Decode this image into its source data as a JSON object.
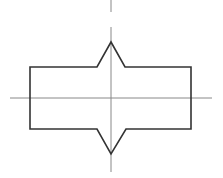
{
  "diagram": {
    "type": "technical-drawing",
    "colors": {
      "background": "#ffffff",
      "outline": "#333333",
      "center_line": "#888888"
    },
    "outline_points": "30,67 97,67 111,42 125,67 191,67 191,129 126,129 111,154 97,129 30,129",
    "horizontal_center_line": {
      "x1": 10,
      "y1": 98,
      "x2": 212,
      "y2": 98
    },
    "vertical_center_line_segments": [
      {
        "x1": 111,
        "y1": 0,
        "x2": 111,
        "y2": 12
      },
      {
        "x1": 111,
        "y1": 27,
        "x2": 111,
        "y2": 172
      }
    ]
  }
}
